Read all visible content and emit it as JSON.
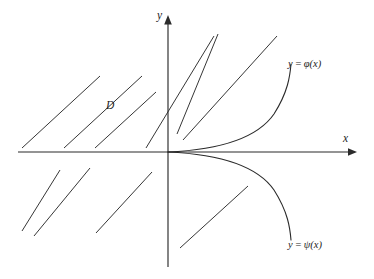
{
  "figure": {
    "kind": "coordinate-plane-diagram",
    "background_color": "#ffffff",
    "stroke_color": "#2b2b2b",
    "width": 374,
    "height": 279
  },
  "axes": {
    "x_axis": {
      "label": "x",
      "y_position": 152,
      "x_start": 18,
      "x_end": 355,
      "arrow": "right"
    },
    "y_axis": {
      "label": "y",
      "x_position": 168,
      "y_start": 16,
      "y_end": 267,
      "arrow": "up"
    },
    "origin": {
      "x": 168,
      "y": 152
    }
  },
  "labels": {
    "region": "D",
    "axis_x": "x",
    "axis_y": "y"
  },
  "curves": [
    {
      "name": "phi",
      "label_y": "y",
      "label_eq": "=",
      "label_fn": "φ(x)",
      "description": "upper branch rising from origin, tangent to x-axis, steep at right",
      "label_position": {
        "x": 288,
        "y": 59
      }
    },
    {
      "name": "psi",
      "label_y": "y",
      "label_eq": "=",
      "label_fn": "ψ(x)",
      "description": "lower branch falling from origin, tangent to x-axis, steep at right",
      "label_position": {
        "x": 288,
        "y": 240
      }
    }
  ],
  "chart_data": {
    "type": "line",
    "title": "",
    "xlabel": "x",
    "ylabel": "y",
    "grid": false,
    "legend": "inline-annotations",
    "axis_style": "arrowed-cartesian",
    "series": [
      {
        "name": "y = φ(x)",
        "annotation": "y = φ(x)",
        "path": "M168,152 C214,150 256,140 274,114 C288,92 290,76 291,64"
      },
      {
        "name": "y = ψ(x)",
        "annotation": "y = ψ(x)",
        "path": "M168,152 C214,154 256,164 274,190 C288,212 290,228 291,240"
      }
    ],
    "hatching": {
      "description": "45-degree parallel shading marks of region D",
      "angle_deg": 45,
      "segments": [
        {
          "x1": 22,
          "y1": 148,
          "x2": 100,
          "y2": 76,
          "quadrant": "upper-left"
        },
        {
          "x1": 64,
          "y1": 148,
          "x2": 142,
          "y2": 76,
          "quadrant": "upper-left"
        },
        {
          "x1": 95,
          "y1": 148,
          "x2": 156,
          "y2": 92,
          "quadrant": "upper-left"
        },
        {
          "x1": 146,
          "y1": 148,
          "x2": 214,
          "y2": 36,
          "quadrant": "upper-left-crossing"
        },
        {
          "x1": 177,
          "y1": 134,
          "x2": 218,
          "y2": 34,
          "quadrant": "upper-right"
        },
        {
          "x1": 183,
          "y1": 140,
          "x2": 277,
          "y2": 36,
          "quadrant": "upper-right"
        },
        {
          "x1": 22,
          "y1": 231,
          "x2": 60,
          "y2": 170,
          "quadrant": "lower-left"
        },
        {
          "x1": 34,
          "y1": 236,
          "x2": 90,
          "y2": 168,
          "quadrant": "lower-left"
        },
        {
          "x1": 96,
          "y1": 233,
          "x2": 152,
          "y2": 172,
          "quadrant": "lower-left"
        },
        {
          "x1": 180,
          "y1": 248,
          "x2": 248,
          "y2": 186,
          "quadrant": "lower-right"
        }
      ]
    }
  }
}
